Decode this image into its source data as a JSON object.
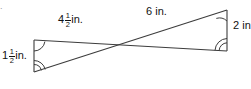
{
  "figure": {
    "problem_number": ".",
    "background_color": "#ffffff",
    "stroke_color": "#3c3c3c",
    "text_color": "#111111"
  },
  "labels": {
    "left_side": {
      "whole": "1",
      "numerator": "1",
      "denominator": "2",
      "unit": "in."
    },
    "top_left_side": {
      "whole": "4",
      "numerator": "1",
      "denominator": "2",
      "unit": "in."
    },
    "top_right_side": {
      "value": "6",
      "unit": "in."
    },
    "right_side": {
      "value": "2",
      "unit": "in."
    }
  },
  "geometry": {
    "vertex_top_left": [
      34,
      40
    ],
    "vertex_bottom_left": [
      34,
      72
    ],
    "vertex_top_right": [
      227,
      10
    ],
    "vertex_bottom_right": [
      227,
      51
    ],
    "crossing_point": [
      117,
      48
    ]
  }
}
